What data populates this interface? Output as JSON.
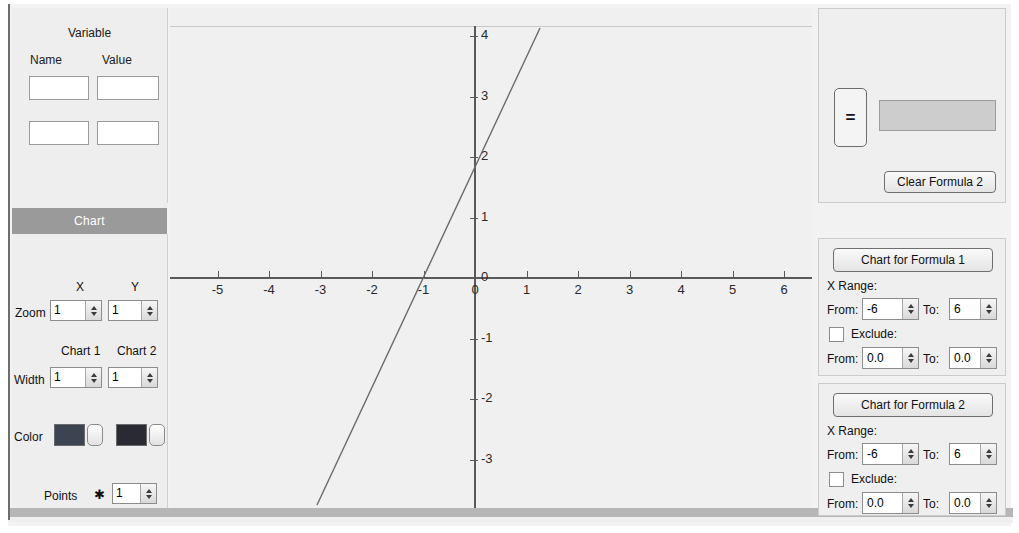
{
  "variable_panel": {
    "title": "Variable",
    "name_header": "Name",
    "value_header": "Value",
    "rows": [
      {
        "name": "",
        "value": ""
      },
      {
        "name": "",
        "value": ""
      }
    ],
    "placeholder": ""
  },
  "chart_panel": {
    "header": "Chart",
    "x_header": "X",
    "y_header": "Y",
    "zoom_label": "Zoom",
    "zoom_x": "1",
    "zoom_y": "1",
    "chart1_header": "Chart 1",
    "chart2_header": "Chart 2",
    "width_label": "Width",
    "width_1": "1",
    "width_2": "1",
    "color_label": "Color",
    "color_1": "#3c4452",
    "color_2": "#2a2a33",
    "points_label": "Points",
    "points_marker": "✱",
    "points_value": "1"
  },
  "formula_panel": {
    "equals_label": "=",
    "formula_value": "",
    "clear_label": "Clear Formula 2"
  },
  "range_panels": [
    {
      "button_label": "Chart for Formula 1",
      "x_range_label": "X Range:",
      "from_label": "From:",
      "to_label": "To:",
      "from_value": "-6",
      "to_value": "6",
      "exclude_label": "Exclude:",
      "exclude_checked": false,
      "exclude_from_label": "From:",
      "exclude_to_label": "To:",
      "exclude_from_value": "0.0",
      "exclude_to_value": "0.0"
    },
    {
      "button_label": "Chart for Formula 2",
      "x_range_label": "X Range:",
      "from_label": "From:",
      "to_label": "To:",
      "from_value": "-6",
      "to_value": "6",
      "exclude_label": "Exclude:",
      "exclude_checked": false,
      "exclude_from_label": "From:",
      "exclude_to_label": "To:",
      "exclude_from_value": "0.0",
      "exclude_to_value": "0.0"
    }
  ],
  "chart_data": {
    "type": "line",
    "title": "",
    "xlabel": "",
    "ylabel": "",
    "xlim": [
      -6,
      6
    ],
    "ylim": [
      -4.5,
      4.5
    ],
    "xticks": [
      -5,
      -4,
      -3,
      -2,
      -1,
      0,
      1,
      2,
      3,
      4,
      5,
      6
    ],
    "xticklabels": [
      "-5",
      "-4",
      "-3",
      "-2",
      "-1",
      "0",
      "1",
      "2",
      "3",
      "4",
      "5",
      "6"
    ],
    "yticks": [
      4,
      3,
      2,
      1,
      0,
      -1,
      -2,
      -3,
      -4
    ],
    "yticklabels": [
      "4",
      "3",
      "2",
      "1",
      "0",
      "-1",
      "-2",
      "-3",
      "-4"
    ],
    "grid": false,
    "legend": null,
    "series": [
      {
        "name": "Formula 1",
        "color": "#6a6a6a",
        "width": 1,
        "x": [
          -1.6,
          0.0,
          1.1
        ],
        "y": [
          -4.2,
          2.0,
          6.2
        ],
        "line_pixels": {
          "x1": 317,
          "y1": 505,
          "x2": 540,
          "y2": 28
        }
      }
    ]
  }
}
